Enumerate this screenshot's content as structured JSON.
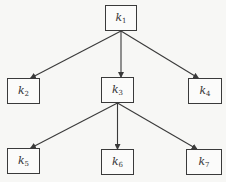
{
  "diagram": {
    "type": "tree",
    "colors": {
      "line": "#3a3a3a",
      "background": "#f7f7f5",
      "box": "#fbfbfa"
    },
    "nodes": [
      {
        "id": "k1",
        "base": "k",
        "sub": "1",
        "x": 105,
        "y": 5,
        "w": 32,
        "h": 26
      },
      {
        "id": "k2",
        "base": "k",
        "sub": "2",
        "x": 7,
        "y": 78,
        "w": 33,
        "h": 26
      },
      {
        "id": "k3",
        "base": "k",
        "sub": "3",
        "x": 101,
        "y": 77,
        "w": 33,
        "h": 26
      },
      {
        "id": "k4",
        "base": "k",
        "sub": "4",
        "x": 188,
        "y": 78,
        "w": 34,
        "h": 26
      },
      {
        "id": "k5",
        "base": "k",
        "sub": "5",
        "x": 7,
        "y": 148,
        "w": 33,
        "h": 26
      },
      {
        "id": "k6",
        "base": "k",
        "sub": "6",
        "x": 101,
        "y": 149,
        "w": 33,
        "h": 26
      },
      {
        "id": "k7",
        "base": "k",
        "sub": "7",
        "x": 186,
        "y": 149,
        "w": 36,
        "h": 26
      }
    ],
    "edges": [
      {
        "from": "k1",
        "to": "k2"
      },
      {
        "from": "k1",
        "to": "k3"
      },
      {
        "from": "k1",
        "to": "k4"
      },
      {
        "from": "k3",
        "to": "k5"
      },
      {
        "from": "k3",
        "to": "k6"
      },
      {
        "from": "k3",
        "to": "k7"
      }
    ]
  }
}
